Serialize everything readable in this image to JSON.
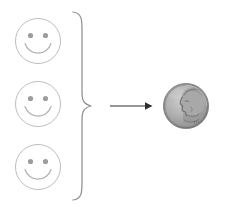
{
  "figure": {
    "name": "three-smileys-equal-one-dime",
    "background_color": "#ffffff",
    "width": 225,
    "height": 211
  },
  "smileys": {
    "count": 3,
    "icon_name": "smiley-face-icon",
    "outline_color": "#b8b8b8",
    "feature_color": "#9a9a9a",
    "radius": 23,
    "items": [
      {
        "label": "smiley-face-1",
        "cx": 38,
        "cy": 41
      },
      {
        "label": "smiley-face-2",
        "cx": 38,
        "cy": 104
      },
      {
        "label": "smiley-face-3",
        "cx": 38,
        "cy": 167
      }
    ]
  },
  "brace": {
    "icon_name": "right-curly-brace",
    "color": "#8c8c8c",
    "top_y": 12,
    "bottom_y": 200,
    "tip_x": 91,
    "tip_y": 106,
    "spine_x": 74
  },
  "arrow": {
    "icon_name": "arrow-right-icon",
    "color": "#2b2b2b",
    "start_x": 110,
    "end_x": 152,
    "y": 106
  },
  "coin": {
    "icon_name": "us-dime-coin",
    "name": "dime",
    "obverse_text": "LIBERTY",
    "portrait": "roosevelt-profile",
    "cx": 186,
    "cy": 106,
    "radius": 23,
    "rim_color": "#8d8d8d",
    "face_color": "#b0b0b0",
    "shadow_color": "#7a7a7a",
    "highlight_color": "#d2d2d2"
  }
}
